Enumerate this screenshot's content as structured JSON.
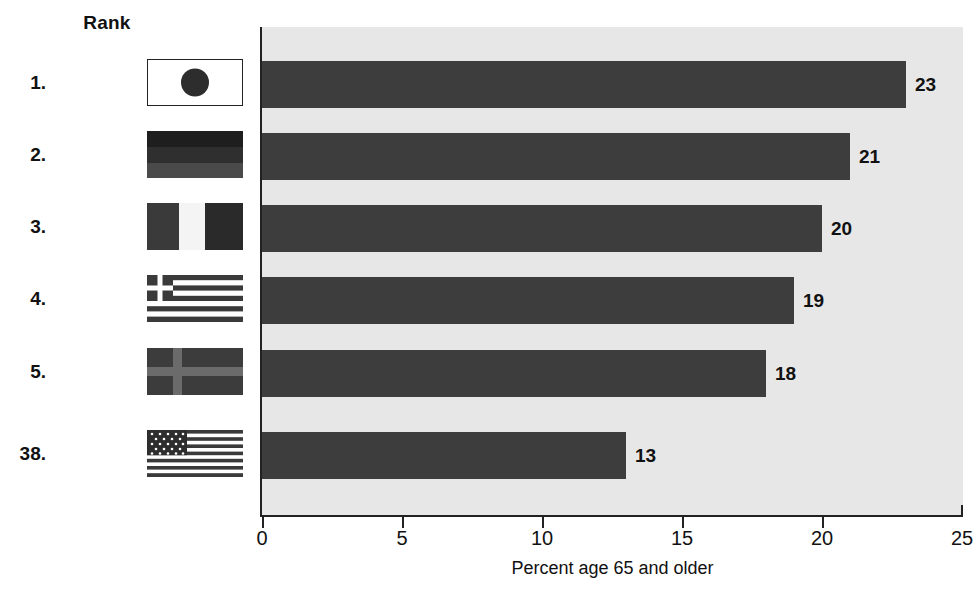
{
  "header": {
    "rank_label": "Rank"
  },
  "chart_data": {
    "type": "bar",
    "orientation": "horizontal",
    "title": "",
    "xlabel": "Percent age 65 and older",
    "ylabel": "",
    "xlim": [
      0,
      25
    ],
    "xticks": [
      0,
      5,
      10,
      15,
      20,
      25
    ],
    "xtick_labels": [
      "0",
      "5",
      "10",
      "15",
      "20",
      "25"
    ],
    "grid": false,
    "legend": null,
    "bar_color": "#3d3d3d",
    "plot_background": "#e7e7e7",
    "categories": [
      "Japan",
      "Germany",
      "Italy",
      "Greece",
      "Sweden",
      "USA"
    ],
    "values": [
      23,
      21,
      20,
      19,
      18,
      13
    ],
    "value_labels": [
      "23",
      "21",
      "20",
      "19",
      "18",
      "13"
    ],
    "ranks": [
      "1.",
      "2.",
      "3.",
      "4.",
      "5.",
      "38."
    ]
  },
  "rows": [
    {
      "rank": "1.",
      "country": "Japan",
      "value": 23,
      "value_label": "23",
      "flag_icon": "flag-japan-icon"
    },
    {
      "rank": "2.",
      "country": "Germany",
      "value": 21,
      "value_label": "21",
      "flag_icon": "flag-germany-icon"
    },
    {
      "rank": "3.",
      "country": "Italy",
      "value": 20,
      "value_label": "20",
      "flag_icon": "flag-italy-icon"
    },
    {
      "rank": "4.",
      "country": "Greece",
      "value": 19,
      "value_label": "19",
      "flag_icon": "flag-greece-icon"
    },
    {
      "rank": "5.",
      "country": "Sweden",
      "value": 18,
      "value_label": "18",
      "flag_icon": "flag-sweden-icon"
    },
    {
      "rank": "38.",
      "country": "USA",
      "value": 13,
      "value_label": "13",
      "flag_icon": "flag-usa-icon"
    }
  ],
  "axis": {
    "title": "Percent age 65 and older",
    "ticks": [
      "0",
      "5",
      "10",
      "15",
      "20",
      "25"
    ]
  }
}
